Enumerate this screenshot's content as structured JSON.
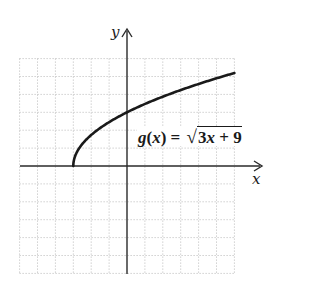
{
  "chart_data": {
    "type": "line",
    "title": "",
    "function": "g(x) = sqrt(3x + 9)",
    "xlabel": "x",
    "ylabel": "y",
    "xlim": [
      -6,
      6
    ],
    "ylim": [
      -6,
      6
    ],
    "grid": true,
    "grid_step": 1,
    "series": [
      {
        "name": "g(x) = √(3x + 9)",
        "x": [
          -3,
          -2.75,
          -2.5,
          -2,
          -1.5,
          -1,
          0,
          1,
          2,
          3,
          4,
          5,
          6
        ],
        "y": [
          0,
          0.866,
          1.225,
          1.732,
          2.121,
          2.449,
          3,
          3.464,
          3.873,
          4.243,
          4.583,
          4.899,
          5.196
        ]
      }
    ],
    "annotations": [
      {
        "text": "g(x) = √3x + 9",
        "position": "upper right of origin, above x-axis"
      }
    ],
    "colors": {
      "curve": "#1a1a1a",
      "axes": "#2a2a2a",
      "grid": "#b8b8b8"
    }
  },
  "labels": {
    "x_axis": "x",
    "y_axis": "y",
    "eq_func": "g",
    "eq_open": "(",
    "eq_var": "x",
    "eq_close": ") = ",
    "eq_radical": "√",
    "eq_coef": "3",
    "eq_rad_var": "x",
    "eq_rest": " + 9"
  }
}
